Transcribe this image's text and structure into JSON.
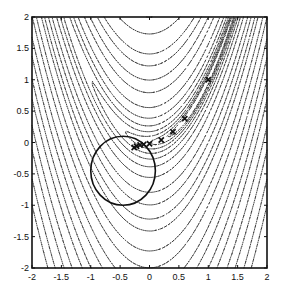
{
  "chart_data": {
    "type": "contour",
    "title": "",
    "xlabel": "",
    "ylabel": "",
    "xlim": [
      -2,
      2
    ],
    "ylim": [
      -2,
      2
    ],
    "grid": false,
    "x_ticks": [
      "-2",
      "-1.5",
      "-1",
      "-0.5",
      "0",
      "0.5",
      "1",
      "1.5",
      "2"
    ],
    "y_ticks": [
      "-2",
      "-1.5",
      "-1",
      "-0.5",
      "0",
      "0.5",
      "1",
      "1.5",
      "2"
    ],
    "contour_function": "Rosenbrock (banana valley along y = x^2)",
    "contour_style": "dotted",
    "contour_levels": [
      0.5,
      1,
      2,
      4,
      8,
      16,
      32,
      64,
      100,
      150,
      200,
      300,
      400,
      550,
      700,
      900,
      1100,
      1400,
      1700,
      2100,
      2500
    ],
    "trust_region_circle": {
      "center": [
        -0.45,
        -0.45
      ],
      "radius": 0.55,
      "style": "solid"
    },
    "iterates": {
      "marker": "x",
      "points": [
        [
          1.0,
          1.0
        ],
        [
          0.6,
          0.38
        ],
        [
          0.4,
          0.17
        ],
        [
          0.2,
          0.04
        ],
        [
          0.0,
          -0.02
        ],
        [
          -0.1,
          -0.03
        ],
        [
          -0.16,
          -0.04
        ],
        [
          -0.22,
          -0.06
        ],
        [
          -0.26,
          -0.08
        ]
      ]
    }
  }
}
